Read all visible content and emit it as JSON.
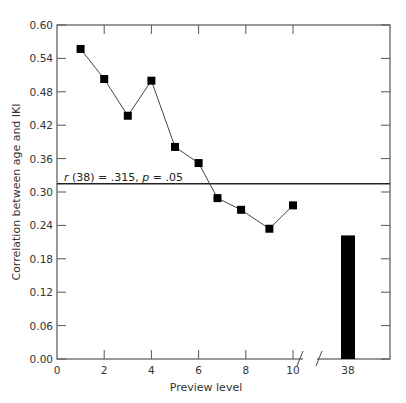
{
  "chart_data": {
    "type": "line",
    "title": "",
    "xlabel": "Preview level",
    "ylabel": "Correlation between age and IKI",
    "ylim": [
      0.0,
      0.6
    ],
    "yticks": [
      "0.00",
      "0.06",
      "0.12",
      "0.18",
      "0.24",
      "0.30",
      "0.36",
      "0.42",
      "0.48",
      "0.54",
      "0.60"
    ],
    "xticks": [
      "0",
      "2",
      "4",
      "6",
      "8",
      "10",
      "38"
    ],
    "grid": false,
    "legend": null,
    "axis_break": "between 10 and 38",
    "series": [
      {
        "name": "Preview levels 1–10",
        "marker": "square",
        "x": [
          1,
          2,
          3,
          4,
          5,
          6,
          6.8,
          7.8,
          9,
          10
        ],
        "values": [
          0.557,
          0.503,
          0.437,
          0.5,
          0.381,
          0.352,
          0.289,
          0.268,
          0.234,
          0.276
        ]
      },
      {
        "name": "Preview level 38",
        "type": "bar",
        "x": [
          38
        ],
        "values": [
          0.222
        ]
      }
    ],
    "reference_line": {
      "y": 0.315,
      "label_r": "r",
      "label_mid": " (38) = .315, ",
      "label_p": "p",
      "label_end": " = .05"
    }
  }
}
